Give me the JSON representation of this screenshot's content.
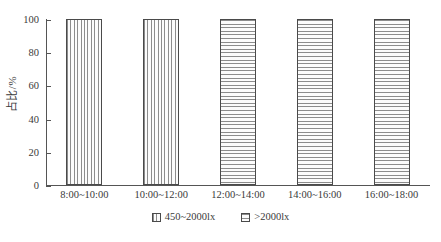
{
  "chart_data": {
    "type": "bar",
    "title": "",
    "xlabel": "",
    "ylabel": "占比/%",
    "categories": [
      "8:00~10:00",
      "10:00~12:00",
      "12:00~14:00",
      "14:00~16:00",
      "16:00~18:00"
    ],
    "values": [
      100,
      100,
      100,
      100,
      100
    ],
    "bar_series": [
      "450~2000lx",
      "450~2000lx",
      ">2000lx",
      ">2000lx",
      ">2000lx"
    ],
    "bar_patterns": [
      "vertical-stripes",
      "vertical-stripes",
      "horizontal-stripes",
      "horizontal-stripes",
      "horizontal-stripes"
    ],
    "ylim": [
      0,
      100
    ],
    "ytick_values": [
      0,
      20,
      40,
      60,
      80,
      100
    ],
    "ytick_labels": [
      "0",
      "20",
      "40",
      "60",
      "80",
      "100"
    ],
    "grid": false,
    "legend_position": "bottom",
    "legend": [
      {
        "label": "450~2000lx",
        "pattern": "vertical-stripes"
      },
      {
        "label": ">2000lx",
        "pattern": "horizontal-stripes"
      }
    ],
    "colors": {
      "axis": "#555555",
      "bar_border": "#4a4a4a",
      "hatch": "#8c8c8c",
      "bar_fill": "#f2f2f2",
      "text": "#3a3a3a",
      "background": "#ffffff"
    }
  }
}
